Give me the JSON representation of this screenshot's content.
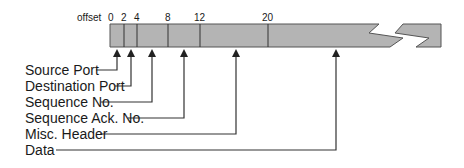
{
  "diagram": {
    "offset_label": "offset",
    "ticks": [
      {
        "label": "0",
        "x": 110
      },
      {
        "label": "2",
        "x": 124
      },
      {
        "label": "4",
        "x": 137
      },
      {
        "label": "8",
        "x": 168
      },
      {
        "label": "12",
        "x": 200
      },
      {
        "label": "20",
        "x": 268
      }
    ],
    "fields": [
      {
        "label": "Source Port",
        "arrow_x": 117
      },
      {
        "label": "Destination Port",
        "arrow_x": 131
      },
      {
        "label": "Sequence No.",
        "arrow_x": 152
      },
      {
        "label": "Sequence Ack. No.",
        "arrow_x": 184
      },
      {
        "label": "Misc. Header",
        "arrow_x": 236
      },
      {
        "label": "Data",
        "arrow_x": 336
      }
    ],
    "colors": {
      "bar_fill": "#b4b4b4",
      "bar_stroke": "#555555",
      "line": "#333333"
    }
  }
}
